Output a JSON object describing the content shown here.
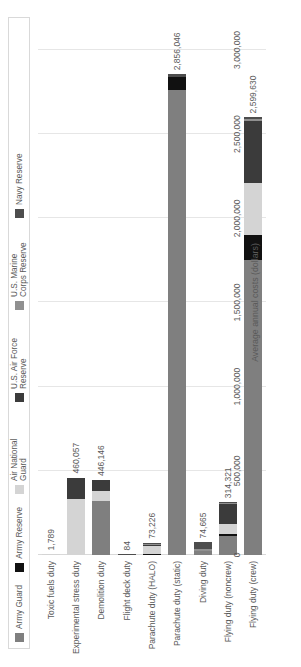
{
  "chart_data": {
    "type": "bar",
    "orientation": "horizontal",
    "stacked": true,
    "title": "",
    "xlabel": "Average annual costs (dollars)",
    "ylabel": "",
    "xlim": [
      0,
      3000000
    ],
    "xticks": [
      "0",
      "500,000",
      "1,000,000",
      "1,500,000",
      "2,000,000",
      "2,500,000",
      "3,000,000"
    ],
    "xtick_values": [
      0,
      500000,
      1000000,
      1500000,
      2000000,
      2500000,
      3000000
    ],
    "grid": true,
    "legend_position": "top",
    "categories": [
      "Toxic fuels duty",
      "Experimental stress duty",
      "Demolition duty",
      "Flight deck duty",
      "Parachute duty (HALO)",
      "Parachute duty (static)",
      "Diving duty",
      "Flying duty (noncrew)",
      "Flying duty (crew)"
    ],
    "totals": [
      1789,
      460057,
      446146,
      84,
      73226,
      2856046,
      74665,
      314321,
      2599630
    ],
    "total_labels": [
      "1,789",
      "460,057",
      "446,146",
      "84",
      "73,226",
      "2,856,046",
      "74,665",
      "314,321",
      "2,599,630"
    ],
    "series": [
      {
        "name": "Army Guard",
        "color": "#7f7f7f",
        "values": [
          0,
          0,
          320000,
          0,
          0,
          2760000,
          26000,
          110000,
          1750000
        ]
      },
      {
        "name": "Army Reserve",
        "color": "#111111",
        "values": [
          0,
          0,
          0,
          0,
          8000,
          78000,
          0,
          12000,
          150000
        ]
      },
      {
        "name": "Air National Guard",
        "color": "#d4d4d4",
        "values": [
          1789,
          330000,
          60000,
          0,
          48000,
          0,
          0,
          62000,
          310000
        ]
      },
      {
        "name": "U.S. Air Force Reserve",
        "color": "#3b3b3b",
        "values": [
          0,
          130057,
          66146,
          0,
          6000,
          0,
          0,
          118000,
          370000
        ]
      },
      {
        "name": "U.S. Marine Corps Reserve",
        "color": "#909090",
        "values": [
          0,
          0,
          0,
          0,
          5226,
          0,
          9665,
          6321,
          9630
        ]
      },
      {
        "name": "Navy Reserve",
        "color": "#4d4d4d",
        "values": [
          0,
          0,
          0,
          84,
          6000,
          18046,
          39000,
          6000,
          10000
        ]
      }
    ]
  },
  "legend": {
    "items": [
      {
        "label": "Army Guard",
        "color": "#7f7f7f"
      },
      {
        "label": "Army Reserve",
        "color": "#111111"
      },
      {
        "label": "Air National Guard",
        "color": "#d4d4d4"
      },
      {
        "label": "U.S. Air Force Reserve",
        "color": "#3b3b3b"
      },
      {
        "label": "U.S. Marine Corps Reserve",
        "color": "#909090"
      },
      {
        "label": "Navy Reserve",
        "color": "#4d4d4d"
      }
    ]
  }
}
